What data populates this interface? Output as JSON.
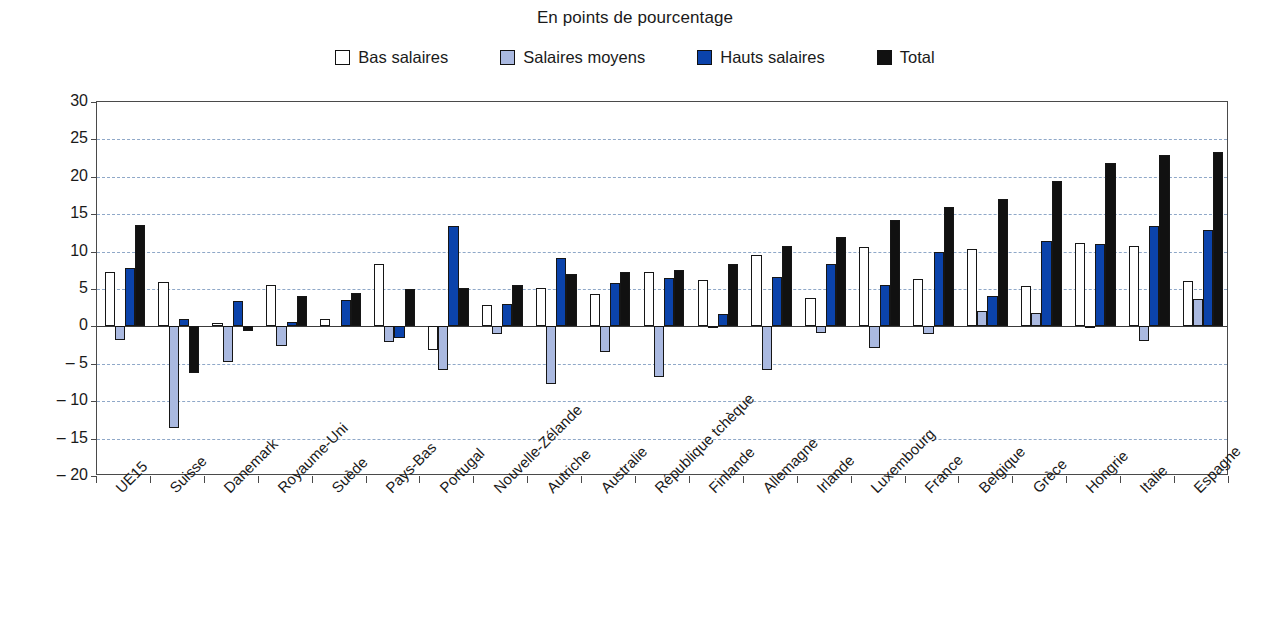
{
  "chart_data": {
    "type": "bar",
    "title": "En points de pourcentage",
    "xlabel": "",
    "ylabel": "",
    "ylim": [
      -20,
      30
    ],
    "ytick_step": 5,
    "yticks": [
      "30",
      "25",
      "20",
      "15",
      "10",
      "5",
      "0",
      "– 5",
      "– 10",
      "– 15",
      "– 20"
    ],
    "grid": true,
    "legend_position": "top",
    "categories": [
      "UE15",
      "Suisse",
      "Danemark",
      "Royaume-Uni",
      "Suède",
      "Pays-Bas",
      "Portugal",
      "Nouvelle-Zélande",
      "Autriche",
      "Australie",
      "République tchèque",
      "Finlande",
      "Allemagne",
      "Irlande",
      "Luxembourg",
      "France",
      "Belgique",
      "Grèce",
      "Hongrie",
      "Italie",
      "Espagne"
    ],
    "series": [
      {
        "name": "Bas salaires",
        "color": "#ffffff",
        "values": [
          7.3,
          6.0,
          0.5,
          5.5,
          1.0,
          8.3,
          -3.2,
          2.8,
          5.1,
          4.3,
          7.3,
          6.2,
          9.6,
          3.8,
          10.6,
          6.4,
          10.3,
          5.4,
          11.1,
          10.8,
          6.1
        ]
      },
      {
        "name": "Salaires moyens",
        "color": "#aab9e0",
        "values": [
          -1.8,
          -13.6,
          -4.8,
          -2.6,
          0.0,
          -2.1,
          -5.8,
          -1.0,
          -7.7,
          -3.4,
          -6.7,
          -0.2,
          -5.8,
          -0.9,
          -2.9,
          -1.0,
          2.0,
          1.8,
          -0.2,
          -1.9,
          3.6
        ]
      },
      {
        "name": "Hauts salaires",
        "color": "#0b43ab",
        "values": [
          7.8,
          1.0,
          3.4,
          0.6,
          3.5,
          -1.6,
          13.4,
          3.0,
          9.2,
          5.8,
          6.5,
          1.6,
          6.6,
          8.4,
          5.6,
          9.9,
          4.0,
          11.4,
          11.0,
          13.4,
          12.9
        ]
      },
      {
        "name": "Total",
        "color": "#111111",
        "values": [
          13.5,
          -6.2,
          -0.6,
          4.0,
          4.5,
          5.0,
          5.2,
          5.5,
          7.0,
          7.3,
          7.5,
          8.3,
          10.8,
          12.0,
          14.2,
          16.0,
          17.0,
          19.5,
          21.8,
          22.9,
          23.3
        ]
      }
    ]
  }
}
